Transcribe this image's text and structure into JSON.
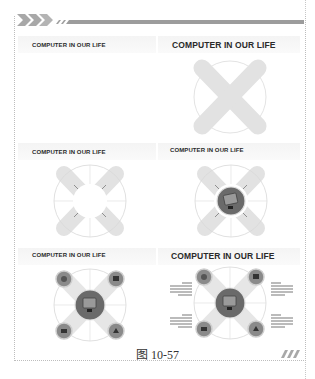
{
  "figure": {
    "caption": "图 10-57",
    "panels": [
      {
        "id": 1,
        "title": "COMPUTER IN OUR LIFE",
        "step": "blank slide with title"
      },
      {
        "id": 2,
        "title": "COMPUTER IN OUR LIFE",
        "step": "circle with X-shaped band"
      },
      {
        "id": 3,
        "title": "COMPUTER IN OUR LIFE",
        "step": "circle with cross lines and center hole"
      },
      {
        "id": 4,
        "title": "COMPUTER IN OUR LIFE",
        "step": "center circle with computer icon"
      },
      {
        "id": 5,
        "title": "COMPUTER IN OUR LIFE",
        "step": "four icon circles added"
      },
      {
        "id": 6,
        "title": "COMPUTER IN OUR LIFE",
        "step": "text blocks added"
      }
    ],
    "icons": [
      "monitor-icon",
      "globe-icon",
      "camera-icon",
      "phone-icon",
      "gamepad-icon"
    ],
    "colors": {
      "band": "#e3e3e3",
      "header_bar": "#9a9a9a",
      "center_circle": "#6d6d6d",
      "circle_line": "#d6d6d6"
    }
  }
}
